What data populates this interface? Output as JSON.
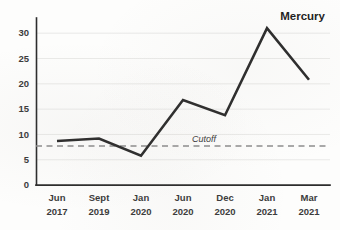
{
  "chart_data": {
    "type": "line",
    "title": "",
    "subtitle": "",
    "xlabel": "",
    "ylabel": "",
    "categories": [
      "Jun 2017",
      "Sept 2019",
      "Jan 2020",
      "Jun 2020",
      "Dec 2020",
      "Jan 2021",
      "Mar 2021"
    ],
    "category_lines": [
      {
        "month": "Jun",
        "year": "2017"
      },
      {
        "month": "Sept",
        "year": "2019"
      },
      {
        "month": "Jan",
        "year": "2020"
      },
      {
        "month": "Jun",
        "year": "2020"
      },
      {
        "month": "Dec",
        "year": "2020"
      },
      {
        "month": "Jan",
        "year": "2021"
      },
      {
        "month": "Mar",
        "year": "2021"
      }
    ],
    "series": [
      {
        "name": "Mercury",
        "color": "#2d2d2d",
        "values": [
          8.7,
          9.2,
          5.8,
          16.8,
          13.8,
          31.0,
          20.8
        ]
      }
    ],
    "ylim": [
      0,
      33
    ],
    "yticks": [
      0,
      5,
      10,
      15,
      20,
      25,
      30
    ],
    "ytick_labels": [
      "0",
      "5",
      "10",
      "15",
      "20",
      "25",
      "30"
    ],
    "grid": true,
    "grid_axis": "y",
    "legend": "none",
    "series_label": {
      "text": "Mercury",
      "position": "top-right"
    },
    "annotations": [
      {
        "type": "hline",
        "label": "Cutoff",
        "value": 7.7,
        "style": "dashed",
        "color": "#8d8d8d",
        "label_style": "italic"
      }
    ],
    "colors": {
      "background": "#fdfdfc",
      "line": "#2d2d2d",
      "grid": "#e4e4e2",
      "axis": "#2d2d2d",
      "cutoff": "#8d8d8d",
      "text": "#3b3b3b"
    }
  }
}
